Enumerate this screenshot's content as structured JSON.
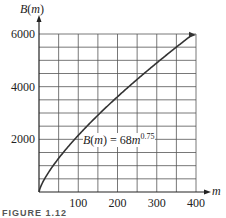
{
  "chart_data": {
    "type": "line",
    "title": "",
    "xlabel": "m",
    "ylabel": "B(m)",
    "xlim": [
      0,
      400
    ],
    "ylim": [
      0,
      6000
    ],
    "x_ticks": [
      100,
      200,
      300,
      400
    ],
    "y_ticks": [
      2000,
      4000,
      6000
    ],
    "x_tick_labels": [
      "100",
      "200",
      "300",
      "400"
    ],
    "y_tick_labels": [
      "2000",
      "4000",
      "6000"
    ],
    "grid": true,
    "grid_x_step": 50,
    "grid_y_step": 500,
    "series": [
      {
        "name": "B(m) = 68m^0.75",
        "formula": "68*m^0.75",
        "x": [
          0,
          25,
          50,
          100,
          150,
          200,
          250,
          300,
          350,
          400
        ],
        "values": [
          0,
          760,
          1279,
          2150,
          2914,
          3616,
          4275,
          4901,
          5501,
          6080
        ]
      }
    ],
    "annotation": {
      "text_prefix": "B(m) = 68m",
      "exponent": "0.75",
      "at_x": 150,
      "at_y": 2000
    }
  },
  "axes": {
    "y_label_main": "B",
    "y_label_arg": "(m)",
    "x_label": "m"
  },
  "caption": "FIGURE 1.12"
}
